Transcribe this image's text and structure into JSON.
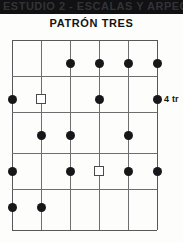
{
  "page": {
    "background_color": "#fdfdfb",
    "width": 183,
    "height": 243
  },
  "top_band": {
    "text": "ESTUDIO 2 - ESCALAS Y ARPEGIOS",
    "background_color": "#111012",
    "text_color": "#3a3a3c"
  },
  "title": "PATRÓN TRES",
  "side_label": {
    "text": "4 tr",
    "note": "text clipped by right edge of image"
  },
  "chart_data": {
    "type": "scatter",
    "title": "PATRÓN TRES",
    "xlabel": "",
    "ylabel": "",
    "grid": true,
    "legend": "none",
    "x_lines": [
      12,
      41,
      70,
      99,
      128,
      157
    ],
    "y_lines": [
      40,
      76,
      112,
      153,
      189,
      230
    ],
    "columns": [
      1,
      2,
      3,
      4,
      5,
      6
    ],
    "rows": [
      1,
      2,
      3,
      4,
      5
    ],
    "marker_styles": {
      "filled_circle": "#17171a",
      "open_square": "#ffffff"
    },
    "markers": [
      {
        "col": 3,
        "row": 1,
        "x": 70,
        "y": 63,
        "style": "filled_circle"
      },
      {
        "col": 4,
        "row": 1,
        "x": 99,
        "y": 63,
        "style": "filled_circle"
      },
      {
        "col": 5,
        "row": 1,
        "x": 128,
        "y": 63,
        "style": "filled_circle"
      },
      {
        "col": 6,
        "row": 1,
        "x": 157,
        "y": 63,
        "style": "filled_circle"
      },
      {
        "col": 1,
        "row": 2,
        "x": 12,
        "y": 99,
        "style": "filled_circle"
      },
      {
        "col": 2,
        "row": 2,
        "x": 41,
        "y": 99,
        "style": "open_square"
      },
      {
        "col": 4,
        "row": 2,
        "x": 99,
        "y": 99,
        "style": "filled_circle"
      },
      {
        "col": 6,
        "row": 2,
        "x": 157,
        "y": 99,
        "style": "filled_circle"
      },
      {
        "col": 2,
        "row": 3,
        "x": 41,
        "y": 135,
        "style": "filled_circle"
      },
      {
        "col": 3,
        "row": 3,
        "x": 70,
        "y": 135,
        "style": "filled_circle"
      },
      {
        "col": 5,
        "row": 3,
        "x": 128,
        "y": 135,
        "style": "filled_circle"
      },
      {
        "col": 1,
        "row": 4,
        "x": 12,
        "y": 171,
        "style": "filled_circle"
      },
      {
        "col": 3,
        "row": 4,
        "x": 70,
        "y": 171,
        "style": "filled_circle"
      },
      {
        "col": 4,
        "row": 4,
        "x": 99,
        "y": 171,
        "style": "open_square"
      },
      {
        "col": 5,
        "row": 4,
        "x": 128,
        "y": 171,
        "style": "filled_circle"
      },
      {
        "col": 6,
        "row": 4,
        "x": 157,
        "y": 171,
        "style": "filled_circle"
      },
      {
        "col": 1,
        "row": 5,
        "x": 12,
        "y": 207,
        "style": "filled_circle"
      },
      {
        "col": 2,
        "row": 5,
        "x": 41,
        "y": 207,
        "style": "filled_circle"
      }
    ],
    "annotations": [
      {
        "text": "4 tr",
        "x": 164,
        "y": 99
      }
    ]
  }
}
